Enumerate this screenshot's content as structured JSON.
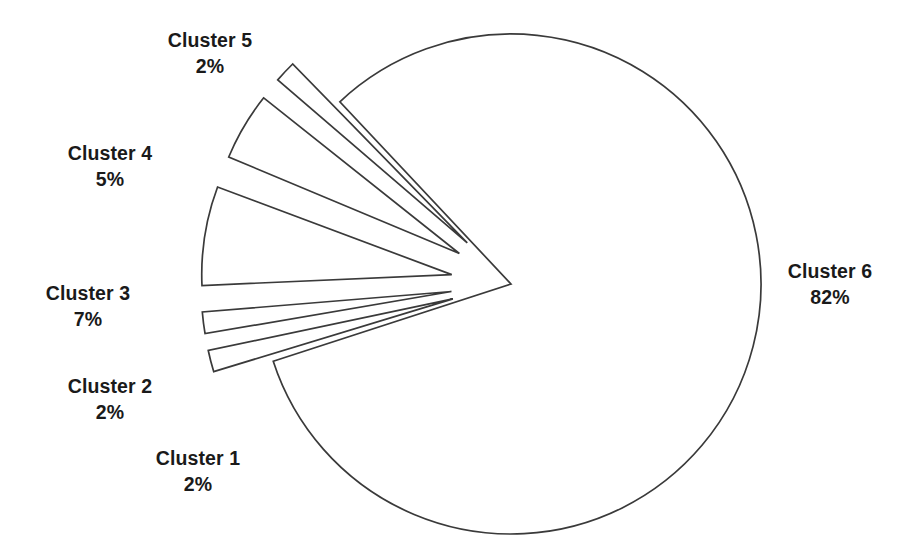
{
  "chart_data": {
    "type": "pie",
    "title": "",
    "subtitle": "",
    "xlabel": "",
    "ylabel": "",
    "legend_position": "none",
    "grid": false,
    "labels_show_name_and_percent": true,
    "categories": [
      "Cluster 1",
      "Cluster 2",
      "Cluster 3",
      "Cluster 4",
      "Cluster 5",
      "Cluster 6"
    ],
    "values": [
      2,
      2,
      7,
      5,
      2,
      82
    ],
    "value_unit": "%",
    "slices": [
      {
        "name": "Cluster 1",
        "value": 2,
        "percent_label": "2%",
        "exploded": true
      },
      {
        "name": "Cluster 2",
        "value": 2,
        "percent_label": "2%",
        "exploded": true
      },
      {
        "name": "Cluster 3",
        "value": 7,
        "percent_label": "7%",
        "exploded": true
      },
      {
        "name": "Cluster 4",
        "value": 5,
        "percent_label": "5%",
        "exploded": true
      },
      {
        "name": "Cluster 5",
        "value": 2,
        "percent_label": "2%",
        "exploded": true
      },
      {
        "name": "Cluster 6",
        "value": 82,
        "percent_label": "82%",
        "exploded": false
      }
    ],
    "style": {
      "fill": "#ffffff",
      "stroke": "#3a3a3a",
      "background": "#ffffff",
      "text_color": "#1a1a1a"
    }
  }
}
